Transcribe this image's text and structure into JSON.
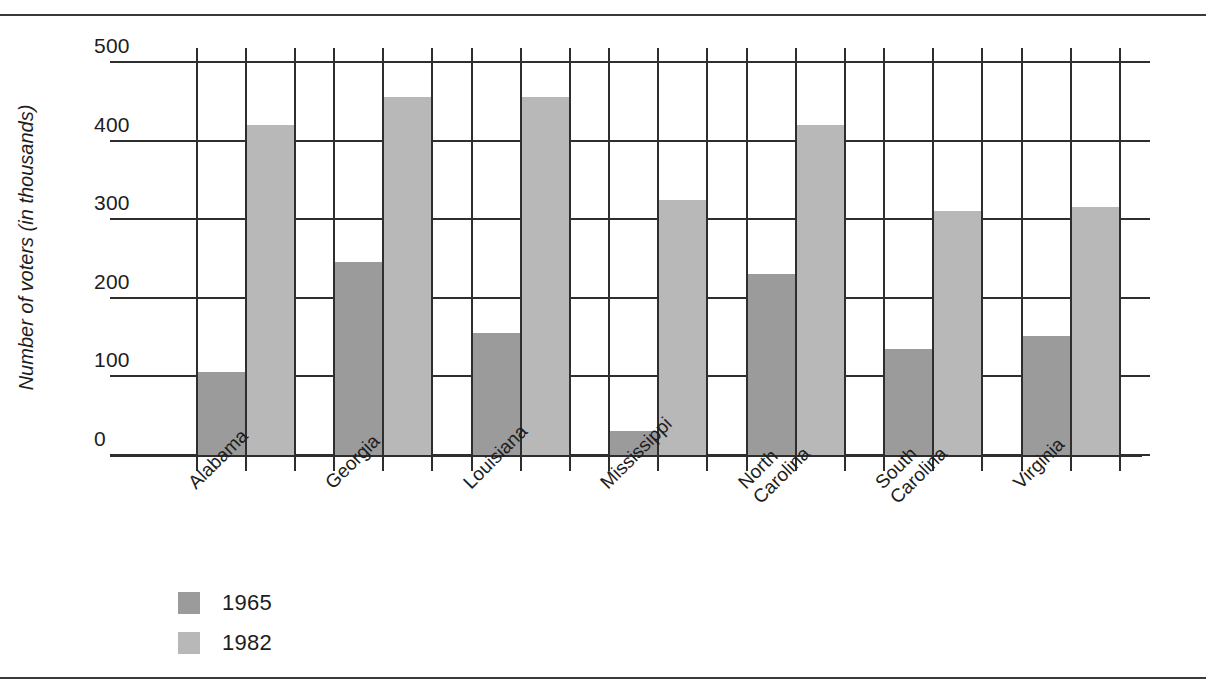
{
  "chart_data": {
    "type": "bar",
    "title": "",
    "xlabel": "",
    "ylabel": "Number of voters (in thousands)",
    "categories": [
      "Alabama",
      "Georgia",
      "Louisiana",
      "Mississippi",
      "North\nCarolina",
      "South\nCarolina",
      "Virginia"
    ],
    "series": [
      {
        "name": "1965",
        "color": "#9b9b9b",
        "values": [
          105,
          245,
          155,
          30,
          230,
          135,
          152
        ]
      },
      {
        "name": "1982",
        "color": "#b8b8b8",
        "values": [
          420,
          455,
          455,
          325,
          420,
          310,
          315
        ]
      }
    ],
    "ylim": [
      0,
      500
    ],
    "yticks": [
      0,
      100,
      200,
      300,
      400,
      500
    ],
    "ytick_labels": [
      "0",
      "100",
      "200",
      "300",
      "400",
      "500"
    ],
    "grid": true,
    "legend_position": "bottom-left"
  },
  "legend": {
    "entries": [
      {
        "label": "1965",
        "color": "#9b9b9b"
      },
      {
        "label": "1982",
        "color": "#b8b8b8"
      }
    ]
  },
  "colors": {
    "series_1965": "#9b9b9b",
    "series_1982": "#b8b8b8",
    "grid": "#2e2e2e",
    "text": "#1d1d1d",
    "rule": "#3a3a3a",
    "background": "#ffffff"
  }
}
